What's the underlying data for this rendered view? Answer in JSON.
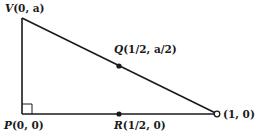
{
  "diagram": {
    "type": "right-triangle",
    "stroke_color": "#1a1a1a",
    "points": {
      "V": {
        "name": "V",
        "coords": "(0, a)",
        "px": [
          22,
          18
        ],
        "marker": "none"
      },
      "P": {
        "name": "P",
        "coords": "(0, 0)",
        "px": [
          22,
          114
        ],
        "marker": "right-angle"
      },
      "Q": {
        "name": "Q",
        "coords": "(1/2, a/2)",
        "px": [
          119,
          66
        ],
        "marker": "filled-dot"
      },
      "R": {
        "name": "R",
        "coords": "(1/2, 0)",
        "px": [
          119,
          114
        ],
        "marker": "filled-dot"
      },
      "E": {
        "name": "",
        "coords": "(1, 0)",
        "px": [
          217,
          114
        ],
        "marker": "open-circle"
      }
    },
    "edges": [
      {
        "from": "V",
        "to": "P"
      },
      {
        "from": "P",
        "to": "E"
      },
      {
        "from": "V",
        "to": "E"
      }
    ]
  }
}
